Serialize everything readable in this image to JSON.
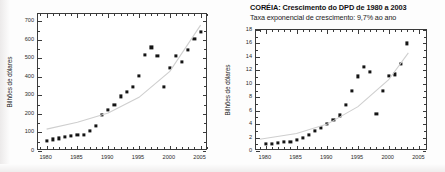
{
  "figure": {
    "background_color": "#fdfdfd",
    "marker_color": "#141414",
    "fit_line_color": "#cfcfcf",
    "axis_color": "#3a3a3a"
  },
  "left_panel": {
    "title": "",
    "subtitle": ""
  },
  "right_panel": {
    "title": "CORÉIA: Crescimento do DPD de 1980 a 2003",
    "subtitle": "Taxa exponencial de crescimento: 9,7% ao ano"
  },
  "chart_data": [
    {
      "type": "scatter",
      "id": "left-chart",
      "title": "",
      "xlabel": "",
      "ylabel": "Bilhões de dólares",
      "xlim": [
        1978.6,
        2006.2
      ],
      "ylim": [
        0,
        740
      ],
      "xticks": [
        1980,
        1985,
        1990,
        1995,
        2000,
        2005
      ],
      "yticks": [
        0,
        100,
        200,
        300,
        400,
        500,
        600,
        700
      ],
      "xtick_labels": [
        "1980",
        "1985",
        "1990",
        "1995",
        "2000",
        "2005"
      ],
      "ytick_labels": [
        "0",
        "100",
        "200",
        "300",
        "400",
        "500",
        "600",
        "700"
      ],
      "grid": false,
      "legend": "none",
      "x": [
        1980,
        1981,
        1982,
        1983,
        1984,
        1985,
        1986,
        1987,
        1988,
        1989,
        1990,
        1991,
        1992,
        1993,
        1994,
        1995,
        1996,
        1997,
        1998,
        1999,
        2000,
        2001,
        2002,
        2003,
        2004,
        2005
      ],
      "values": [
        55,
        63,
        68,
        74,
        80,
        86,
        88,
        108,
        137,
        194,
        221,
        250,
        295,
        318,
        345,
        404,
        517,
        560,
        514,
        345,
        451,
        512,
        483,
        548,
        605,
        642
      ],
      "series": [
        {
          "name": "Dados observados",
          "marker": "square",
          "values": [
            55,
            63,
            68,
            74,
            80,
            86,
            88,
            108,
            137,
            194,
            221,
            250,
            295,
            318,
            345,
            404,
            517,
            560,
            514,
            345,
            451,
            512,
            483,
            548,
            605,
            642
          ]
        },
        {
          "name": "Ajuste exponencial",
          "marker": "line",
          "x": [
            1980,
            1985,
            1990,
            1995,
            2000,
            2005
          ],
          "values": [
            118,
            155,
            205,
            290,
            430,
            680
          ]
        }
      ]
    },
    {
      "type": "scatter",
      "id": "right-chart",
      "title": "CORÉIA: Crescimento do DPD de 1980 a 2003",
      "subtitle": "Taxa exponencial de crescimento: 9,7% ao ano",
      "xlabel": "",
      "ylabel": "Bilhões de dólares",
      "xlim": [
        1978.4,
        2006.4
      ],
      "ylim": [
        0,
        18
      ],
      "xticks": [
        1980,
        1985,
        1990,
        1995,
        2000,
        2005
      ],
      "yticks": [
        0,
        2,
        4,
        6,
        8,
        10,
        12,
        14,
        16,
        18
      ],
      "xtick_labels": [
        "1980",
        "1985",
        "1990",
        "1995",
        "2000",
        "2005"
      ],
      "ytick_labels": [
        "0",
        "2",
        "4",
        "6",
        "8",
        "10",
        "12",
        "14",
        "16",
        "18"
      ],
      "grid": false,
      "legend": "none",
      "growth_rate_percent": 9.7,
      "x": [
        1980,
        1981,
        1982,
        1983,
        1984,
        1985,
        1986,
        1987,
        1988,
        1989,
        1990,
        1991,
        1992,
        1993,
        1994,
        1995,
        1996,
        1997,
        1998,
        1999,
        2000,
        2001,
        2002,
        2003
      ],
      "values": [
        1.0,
        1.1,
        1.2,
        1.3,
        1.4,
        1.6,
        1.9,
        2.4,
        3.0,
        3.4,
        4.0,
        4.6,
        5.3,
        6.9,
        8.9,
        11.1,
        12.5,
        11.8,
        5.5,
        9.0,
        11.2,
        11.4,
        12.9,
        16.0
      ],
      "series": [
        {
          "name": "Dados observados",
          "marker": "square",
          "values": [
            1.0,
            1.1,
            1.2,
            1.3,
            1.4,
            1.6,
            1.9,
            2.4,
            3.0,
            3.4,
            4.0,
            4.6,
            5.3,
            6.9,
            8.9,
            11.1,
            12.5,
            11.8,
            5.5,
            9.0,
            11.2,
            11.4,
            12.9,
            16.0
          ]
        },
        {
          "name": "Ajuste exponencial",
          "marker": "line",
          "x": [
            1979,
            1985,
            1990,
            1995,
            2000,
            2003.2
          ],
          "values": [
            1.75,
            2.6,
            4.0,
            6.6,
            10.6,
            14.6
          ]
        }
      ]
    }
  ]
}
